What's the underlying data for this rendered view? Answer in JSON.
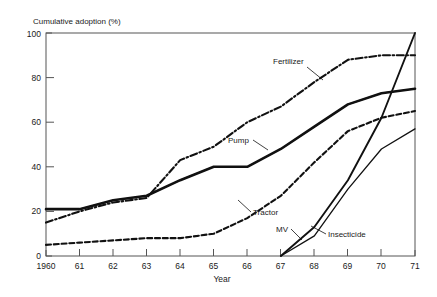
{
  "chart_data": {
    "type": "line",
    "title": "",
    "ylabel": "Cumulative adoption (%)",
    "xlabel": "Year",
    "ylim": [
      0,
      100
    ],
    "yticks": [
      0,
      20,
      40,
      60,
      80,
      100
    ],
    "ytick_labels": [
      "0",
      "20",
      "40",
      "60",
      "80",
      "100"
    ],
    "xlim": [
      1960,
      1971
    ],
    "xticks": [
      1960,
      1961,
      1962,
      1963,
      1964,
      1965,
      1966,
      1967,
      1968,
      1969,
      1970,
      1971
    ],
    "xtick_labels": [
      "1960",
      "61",
      "62",
      "63",
      "64",
      "65",
      "66",
      "67",
      "68",
      "69",
      "70",
      "71"
    ],
    "grid": false,
    "legend": "inline-annotations",
    "x": [
      1960,
      1961,
      1962,
      1963,
      1964,
      1965,
      1966,
      1967,
      1968,
      1969,
      1970,
      1971
    ],
    "series": [
      {
        "name": "Fertilizer",
        "style": "dash-dot",
        "label": "Fertilizer",
        "values": [
          15,
          20,
          24,
          26,
          43,
          49,
          60,
          67,
          78,
          88,
          90,
          90
        ]
      },
      {
        "name": "Pump",
        "style": "double-solid",
        "label": "Pump",
        "values": [
          21,
          21,
          25,
          27,
          34,
          40,
          40,
          48,
          58,
          68,
          73,
          75
        ]
      },
      {
        "name": "Tractor",
        "style": "dashed",
        "label": "Tractor",
        "values": [
          5,
          6,
          7,
          8,
          8,
          10,
          17,
          27,
          42,
          56,
          62,
          65
        ]
      },
      {
        "name": "MV",
        "style": "solid",
        "label": "MV",
        "values": [
          null,
          null,
          null,
          null,
          null,
          null,
          null,
          0,
          13,
          34,
          62,
          100
        ]
      },
      {
        "name": "Insecticide",
        "style": "solid-thin",
        "label": "Insecticide",
        "values": [
          null,
          null,
          null,
          null,
          null,
          null,
          null,
          0,
          9,
          30,
          48,
          57
        ]
      }
    ]
  },
  "labels": {
    "y_axis_title": "Cumulative adoption (%)",
    "x_axis_title": "Year",
    "series_fertilizer": "Fertilizer",
    "series_pump": "Pump",
    "series_tractor": "Tractor",
    "series_mv": "MV",
    "series_insecticide": "Insecticide",
    "y_0": "0",
    "y_20": "20",
    "y_40": "40",
    "y_60": "60",
    "y_80": "80",
    "y_100": "100",
    "x_1960": "1960",
    "x_61": "61",
    "x_62": "62",
    "x_63": "63",
    "x_64": "64",
    "x_65": "65",
    "x_66": "66",
    "x_67": "67",
    "x_68": "68",
    "x_69": "69",
    "x_70": "70",
    "x_71": "71"
  }
}
